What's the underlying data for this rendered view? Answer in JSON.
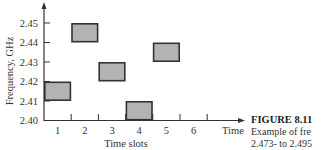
{
  "chart_data": {
    "type": "bar",
    "subtype": "frequency-hopping-timeslot-blocks",
    "title": "",
    "xlabel": "Time slots",
    "x_axis_end_label": "Time",
    "ylabel": "Frequency, GHz",
    "x_ticks": [
      "1",
      "2",
      "3",
      "4",
      "5",
      "6"
    ],
    "y_ticks": [
      "2.40",
      "2.41",
      "2.42",
      "2.43",
      "2.44",
      "2.45"
    ],
    "ylim": [
      2.4,
      2.45
    ],
    "grid": false,
    "legend": null,
    "blocks": [
      {
        "slot": 1,
        "f_low": 2.41,
        "f_high": 2.42
      },
      {
        "slot": 2,
        "f_low": 2.44,
        "f_high": 2.45
      },
      {
        "slot": 3,
        "f_low": 2.42,
        "f_high": 2.43
      },
      {
        "slot": 4,
        "f_low": 2.4,
        "f_high": 2.41
      },
      {
        "slot": 5,
        "f_low": 2.43,
        "f_high": 2.44
      }
    ],
    "block_fill": "#b3b3b3",
    "block_stroke": "#333333"
  },
  "caption": {
    "figure_label": "FIGURE 8.11",
    "line1": "Example of fre",
    "line2": "2.473- to 2.495"
  }
}
